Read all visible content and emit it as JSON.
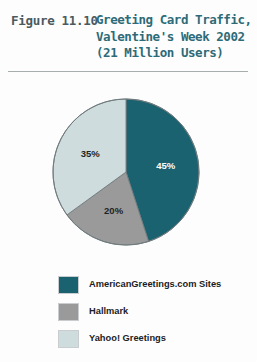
{
  "figure": {
    "number_label": "Figure 11.10",
    "title_lines": [
      "Greeting Card Traffic,",
      "Valentine's Week 2002",
      "(21 Million Users)"
    ],
    "title_full": "Greeting Card Traffic, Valentine's Week 2002 (21 Million Users)"
  },
  "colors": {
    "title_text": "#2d6b78",
    "figure_number_text": "#4a5a60",
    "rule": "#a8adb0",
    "background": "#fdfdfd",
    "slice_american_greetings": "#1b6270",
    "slice_hallmark": "#9a9a9a",
    "slice_yahoo": "#cfdcdd",
    "slice_outline": "#6f7b7e",
    "label_on_dark": "#ffffff",
    "label_on_light": "#1d2426"
  },
  "chart_data": {
    "type": "pie",
    "title": "Greeting Card Traffic, Valentine's Week 2002 (21 Million Users)",
    "categories": [
      "AmericanGreetings.com Sites",
      "Hallmark",
      "Yahoo! Greetings"
    ],
    "values": [
      45,
      20,
      35
    ],
    "value_labels": [
      "45%",
      "20%",
      "35%"
    ],
    "unit": "percent",
    "total_users_millions": 21,
    "start_angle_deg": 0,
    "direction": "clockwise",
    "legend_position": "bottom-left",
    "grid": false,
    "slices": [
      {
        "name": "AmericanGreetings.com Sites",
        "value": 45,
        "label": "45%",
        "color": "#1b6270",
        "label_color": "#ffffff"
      },
      {
        "name": "Hallmark",
        "value": 20,
        "label": "20%",
        "color": "#9a9a9a",
        "label_color": "#1d2426"
      },
      {
        "name": "Yahoo! Greetings",
        "value": 35,
        "label": "35%",
        "color": "#cfdcdd",
        "label_color": "#1d2426"
      }
    ]
  },
  "legend": {
    "items": [
      {
        "label": "AmericanGreetings.com Sites",
        "color": "#1b6270"
      },
      {
        "label": "Hallmark",
        "color": "#9a9a9a"
      },
      {
        "label": "Yahoo! Greetings",
        "color": "#cfdcdd"
      }
    ]
  }
}
